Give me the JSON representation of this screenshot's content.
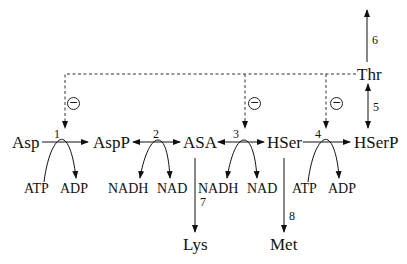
{
  "diagram": {
    "type": "metabolic-pathway",
    "metabolites": {
      "asp": "Asp",
      "aspp": "AspP",
      "asa": "ASA",
      "hser": "HSer",
      "hserp": "HSerP",
      "thr": "Thr",
      "lys": "Lys",
      "met": "Met"
    },
    "cofactors": {
      "r1_in": "ATP",
      "r1_out": "ADP",
      "r2_in": "NADH",
      "r2_out": "NAD",
      "r3_in": "NADH",
      "r3_out": "NAD",
      "r4_in": "ATP",
      "r4_out": "ADP"
    },
    "reactions": {
      "r1": "1",
      "r2": "2",
      "r3": "3",
      "r4": "4",
      "r5": "5",
      "r6": "6",
      "r7": "7",
      "r8": "8"
    },
    "inhibition_symbol": "⊖",
    "inhibitions": [
      {
        "from": "Thr",
        "to": "reaction 1",
        "symbol": "⊖"
      },
      {
        "from": "Thr",
        "to": "reaction 3",
        "symbol": "⊖"
      },
      {
        "from": "Thr",
        "to": "reaction 4",
        "symbol": "⊖"
      }
    ],
    "edges": [
      {
        "from": "Asp",
        "to": "AspP",
        "label": "1",
        "reversible": false
      },
      {
        "from": "AspP",
        "to": "ASA",
        "label": "2",
        "reversible": true
      },
      {
        "from": "ASA",
        "to": "HSer",
        "label": "3",
        "reversible": true
      },
      {
        "from": "HSer",
        "to": "HSerP",
        "label": "4",
        "reversible": false
      },
      {
        "from": "HSerP",
        "to": "Thr",
        "label": "5",
        "reversible": true
      },
      {
        "from": "Thr",
        "to": "out",
        "label": "6",
        "reversible": false
      },
      {
        "from": "ASA",
        "to": "Lys",
        "label": "7",
        "reversible": false
      },
      {
        "from": "HSer",
        "to": "Met",
        "label": "8",
        "reversible": false
      }
    ]
  }
}
